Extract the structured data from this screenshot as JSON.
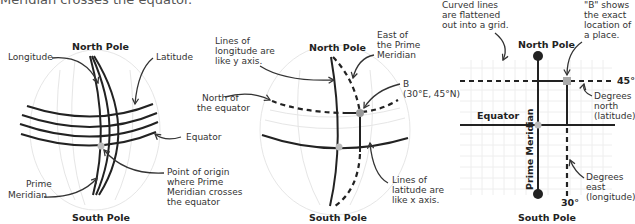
{
  "caption": "Meridian crosses the equator.",
  "panel1": {
    "north_pole": "North Pole",
    "south_pole": "South Pole",
    "longitude": "Longitude",
    "latitude": "Latitude",
    "equator": "Equator",
    "prime_meridian": [
      "Prime",
      "Meridian"
    ],
    "origin": [
      "Point of origin",
      "where Prime",
      "Meridian crosses",
      "the equator"
    ]
  },
  "panel2": {
    "north_pole": "North Pole",
    "south_pole": "South Pole",
    "longitude_note": [
      "Lines of",
      "longitude are",
      "like y axis."
    ],
    "east_note": [
      "East of",
      "the Prime",
      "Meridian"
    ],
    "north_note": [
      "North of",
      "the equator"
    ],
    "point_b": [
      "B",
      "(30°E, 45°N)"
    ],
    "latitude_note": [
      "Lines of",
      "latitude are",
      "like x axis."
    ]
  },
  "panel3": {
    "flat_note": [
      "Curved lines",
      "are flattened",
      "out into a grid."
    ],
    "b_note": [
      "\"B\" shows",
      "the exact",
      "location of",
      "a place."
    ],
    "north_pole": "North Pole",
    "south_pole": "South Pole",
    "equator": "Equator",
    "prime_meridian": "Prime Meridian",
    "lat_tick": "45°",
    "lon_tick": "30°",
    "north_deg": [
      "Degrees",
      "north",
      "(latitude)"
    ],
    "east_deg": [
      "Degrees",
      "east",
      "(longitude)"
    ]
  },
  "colors": {
    "ink": "#222222",
    "point": "#aaaaaa",
    "ghost": "#e6e6e6"
  }
}
